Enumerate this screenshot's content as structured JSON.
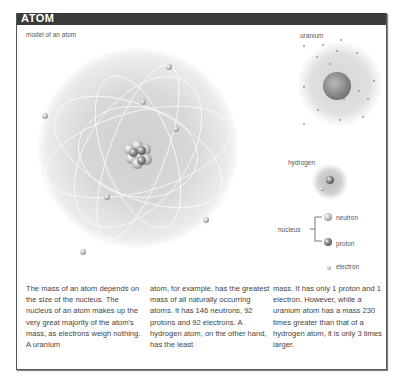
{
  "header": {
    "title": "ATOM"
  },
  "diagram": {
    "main_label": "model of an atom",
    "uranium_label": "uranium",
    "hydrogen_label": "hydrogen",
    "legend": {
      "nucleus_label": "nucleus",
      "neutron_label": "neutron",
      "proton_label": "proton",
      "electron_label": "electron"
    }
  },
  "body_text": {
    "column1": "The mass of an atom depends on the size of the nucleus. The nucleus of an atom makes up the very great majority of the atom's mass, as electrons weigh nothing. A uranium",
    "column2": "atom, for example, has the greatest mass of all naturally occurring atoms. It has 146 neutrons, 92 protons and 92 electrons. A hydrogen atom, on the other hand, has the least",
    "column3": "mass. It has only 1 proton and 1 electron. However, while a uranium atom has a mass 230 times greater than that of a hydrogen atom, it is only 3 times larger."
  },
  "colors": {
    "header_bg": "#3b3b3b",
    "header_text": "#ffffff",
    "text": "#444444"
  }
}
